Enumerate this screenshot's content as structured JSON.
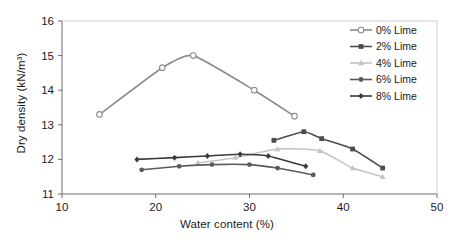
{
  "chart_data": {
    "type": "line",
    "title": "",
    "xlabel": "Water content (%)",
    "ylabel": "Dry density (kN/m3)",
    "ylabel_display": "Dry density (kN/m³)",
    "xlim": [
      10,
      50
    ],
    "ylim": [
      11,
      16
    ],
    "xticks": [
      10,
      20,
      30,
      40,
      50
    ],
    "yticks": [
      11,
      12,
      13,
      14,
      15,
      16
    ],
    "xtick_labels": [
      "10",
      "20",
      "30",
      "40",
      "50"
    ],
    "ytick_labels": [
      "11",
      "12",
      "13",
      "14",
      "15",
      "16"
    ],
    "grid": false,
    "legend_position": "top-right",
    "series": [
      {
        "name": "0% Lime",
        "color": "#8c8c8c",
        "marker": "open-circle",
        "x": [
          14.0,
          20.7,
          24.0,
          30.5,
          34.8
        ],
        "y": [
          13.3,
          14.65,
          15.0,
          14.0,
          13.25
        ]
      },
      {
        "name": "2% Lime",
        "color": "#4d4d4d",
        "marker": "filled-square",
        "x": [
          32.6,
          35.8,
          37.7,
          41.0,
          44.2
        ],
        "y": [
          12.55,
          12.8,
          12.6,
          12.3,
          11.75
        ]
      },
      {
        "name": "4% Lime",
        "color": "#c4c4c4",
        "marker": "filled-triangle",
        "x": [
          24.5,
          28.5,
          33.0,
          37.5,
          41.0,
          44.2
        ],
        "y": [
          11.9,
          12.05,
          12.3,
          12.25,
          11.75,
          11.5
        ]
      },
      {
        "name": "6% Lime",
        "color": "#5a5a5a",
        "marker": "filled-circle",
        "x": [
          18.5,
          22.5,
          26.0,
          30.0,
          33.0,
          36.8
        ],
        "y": [
          11.7,
          11.8,
          11.85,
          11.85,
          11.75,
          11.55
        ]
      },
      {
        "name": "8% Lime",
        "color": "#3a3a3a",
        "marker": "filled-diamond",
        "x": [
          18.0,
          22.0,
          25.5,
          29.0,
          32.0,
          36.0
        ],
        "y": [
          12.0,
          12.05,
          12.1,
          12.15,
          12.1,
          11.8
        ]
      }
    ]
  },
  "legend": {
    "items": [
      {
        "label": "0% Lime"
      },
      {
        "label": "2% Lime"
      },
      {
        "label": "4% Lime"
      },
      {
        "label": "6% Lime"
      },
      {
        "label": "8% Lime"
      }
    ]
  }
}
